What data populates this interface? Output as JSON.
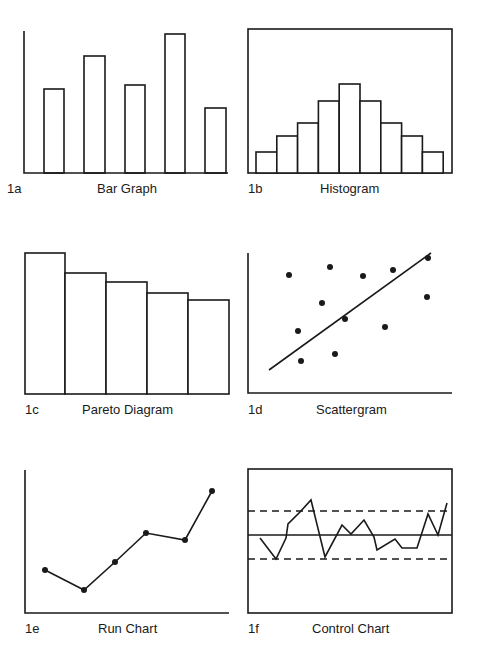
{
  "colors": {
    "ink": "#1a1a1a",
    "background": "#ffffff"
  },
  "panels": [
    {
      "id": "1a",
      "title": "Bar Graph"
    },
    {
      "id": "1b",
      "title": "Histogram"
    },
    {
      "id": "1c",
      "title": "Pareto Diagram"
    },
    {
      "id": "1d",
      "title": "Scattergram"
    },
    {
      "id": "1e",
      "title": "Run Chart"
    },
    {
      "id": "1f",
      "title": "Control Chart"
    }
  ],
  "chart_data": [
    {
      "panel": "1a",
      "type": "bar",
      "title": "Bar Graph",
      "categories": [
        "1",
        "2",
        "3",
        "4",
        "5"
      ],
      "values": [
        59,
        82,
        62,
        97,
        46
      ],
      "xlabel": "",
      "ylabel": "",
      "axes": "L-shaped",
      "grid": false,
      "geom": {
        "axis_x": 24,
        "axis_top": 31,
        "baseline": 173,
        "axis_right": 228,
        "bars": [
          [
            44,
            64,
            89
          ],
          [
            84,
            105,
            56
          ],
          [
            125,
            145,
            85
          ],
          [
            165,
            185,
            34
          ],
          [
            205,
            226,
            108
          ]
        ]
      }
    },
    {
      "panel": "1b",
      "type": "bar",
      "title": "Histogram",
      "categories": [
        "1",
        "2",
        "3",
        "4",
        "5",
        "6",
        "7",
        "8",
        "9"
      ],
      "values": [
        15,
        26,
        35,
        50,
        62,
        50,
        35,
        26,
        15
      ],
      "axes": "boxed",
      "grid": false,
      "geom": {
        "box": [
          248,
          29,
          452,
          173
        ],
        "bar_start": 256,
        "bar_width": 20.8,
        "tops": [
          152,
          136,
          123,
          101,
          84,
          101,
          123,
          136,
          152
        ]
      }
    },
    {
      "panel": "1c",
      "type": "bar",
      "title": "Pareto Diagram",
      "categories": [
        "1",
        "2",
        "3",
        "4",
        "5"
      ],
      "values": [
        100,
        86,
        79,
        71,
        66
      ],
      "axes": "baseline-only",
      "grid": false,
      "geom": {
        "baseline": 394,
        "bars": [
          [
            25,
            65,
            253
          ],
          [
            65,
            106,
            273
          ],
          [
            106,
            147,
            282
          ],
          [
            147,
            188,
            293
          ],
          [
            188,
            229,
            300
          ]
        ]
      }
    },
    {
      "panel": "1d",
      "type": "scatter",
      "title": "Scattergram",
      "points": [
        [
          289,
          275
        ],
        [
          330,
          267
        ],
        [
          363,
          276
        ],
        [
          393,
          270
        ],
        [
          428,
          258
        ],
        [
          322,
          303
        ],
        [
          427,
          297
        ],
        [
          298,
          331
        ],
        [
          345,
          319
        ],
        [
          385,
          327
        ],
        [
          301,
          361
        ],
        [
          335,
          354
        ]
      ],
      "trendline": [
        [
          269,
          370
        ],
        [
          431,
          253
        ]
      ],
      "axes": "L-shaped",
      "grid": false,
      "geom": {
        "axis_x": 248,
        "axis_top": 253,
        "baseline": 393,
        "axis_right": 452
      }
    },
    {
      "panel": "1e",
      "type": "line",
      "title": "Run Chart",
      "points": [
        [
          45,
          570
        ],
        [
          84,
          590
        ],
        [
          115,
          562
        ],
        [
          146,
          533
        ],
        [
          185,
          540
        ],
        [
          212,
          491
        ]
      ],
      "values": [
        30,
        16,
        36,
        56,
        51,
        86
      ],
      "markers": true,
      "axes": "L-shaped",
      "grid": false,
      "geom": {
        "axis_x": 25,
        "axis_top": 470,
        "baseline": 613,
        "axis_right": 229
      }
    },
    {
      "panel": "1f",
      "type": "line",
      "title": "Control Chart",
      "points": [
        [
          260,
          538
        ],
        [
          276,
          559
        ],
        [
          286,
          538
        ],
        [
          288,
          524
        ],
        [
          300,
          512
        ],
        [
          311,
          500
        ],
        [
          325,
          557
        ],
        [
          342,
          525
        ],
        [
          351,
          534
        ],
        [
          364,
          520
        ],
        [
          374,
          537
        ],
        [
          377,
          550
        ],
        [
          395,
          539
        ],
        [
          402,
          548
        ],
        [
          417,
          548
        ],
        [
          428,
          514
        ],
        [
          438,
          535
        ],
        [
          447,
          503
        ]
      ],
      "center_line_y": 535,
      "upper_control_limit_y": 511,
      "lower_control_limit_y": 559,
      "markers": false,
      "axes": "boxed",
      "grid": false,
      "geom": {
        "box": [
          248,
          469,
          452,
          613
        ]
      }
    }
  ]
}
